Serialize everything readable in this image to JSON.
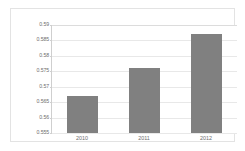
{
  "chart_data": {
    "type": "bar",
    "title": "",
    "subtitle": "",
    "xlabel": "",
    "ylabel": "",
    "categories": [
      "2010",
      "2011",
      "2012"
    ],
    "values": [
      0.567,
      0.576,
      0.587
    ],
    "series": [
      {
        "name": "",
        "values": [
          0.567,
          0.576,
          0.587
        ]
      }
    ],
    "ylim": [
      0.555,
      0.59
    ],
    "yticks": [
      0.555,
      0.56,
      0.565,
      0.57,
      0.575,
      0.58,
      0.585,
      0.59
    ],
    "ytick_labels": [
      "0.555",
      "0.56",
      "0.565",
      "0.57",
      "0.575",
      "0.58",
      "0.585",
      "0.59"
    ],
    "grid": true,
    "grid_axis": "y",
    "legend": false,
    "legend_position": "none",
    "annotations": [],
    "colors": {
      "bar": "#808080",
      "plot_background": "#ffffff",
      "figure_background": "#ffffff",
      "gridline": "#e8e8e8",
      "axis_line": "#cfcfcf",
      "frame_border": "#e3e3e3",
      "tick_label": "#6e6e6e"
    }
  }
}
